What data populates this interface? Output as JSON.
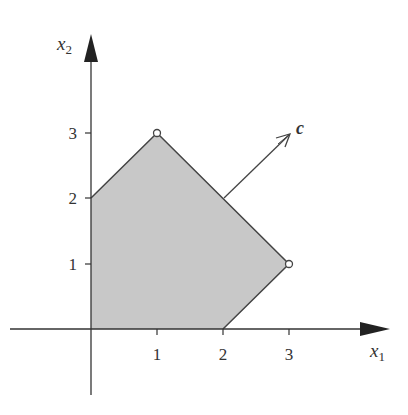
{
  "diagram": {
    "type": "linear-program-feasible-region",
    "axes": {
      "x": {
        "label": "x",
        "subscript": "1",
        "ticks": [
          "1",
          "2",
          "3"
        ]
      },
      "y": {
        "label": "x",
        "subscript": "2",
        "ticks": [
          "1",
          "2",
          "3"
        ]
      }
    },
    "polygon": {
      "vertices": [
        [
          0,
          0
        ],
        [
          2,
          0
        ],
        [
          3,
          1
        ],
        [
          1,
          3
        ],
        [
          0,
          2
        ]
      ],
      "fill": "#c8c8c8",
      "stroke": "#444444"
    },
    "highlighted_vertices": [
      [
        1,
        3
      ],
      [
        3,
        1
      ]
    ],
    "vector": {
      "label": "c",
      "from": [
        2,
        2
      ],
      "direction": [
        1,
        1
      ]
    }
  },
  "colors": {
    "axis": "#333333",
    "fill": "#c8c8c8",
    "edge": "#444444"
  }
}
